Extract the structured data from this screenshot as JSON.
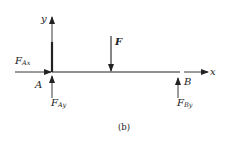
{
  "diagram": {
    "caption": "(b)",
    "axes": {
      "x_label": "x",
      "y_label": "y"
    },
    "points": {
      "A": "A",
      "B": "B"
    },
    "forces": {
      "F": {
        "main": "F",
        "sub": ""
      },
      "F_Ax": {
        "main": "F",
        "sub": "Ax"
      },
      "F_Ay": {
        "main": "F",
        "sub": "Ay"
      },
      "F_By": {
        "main": "F",
        "sub": "By"
      }
    },
    "colors": {
      "stroke": "#222222",
      "background": "#ffffff"
    }
  }
}
